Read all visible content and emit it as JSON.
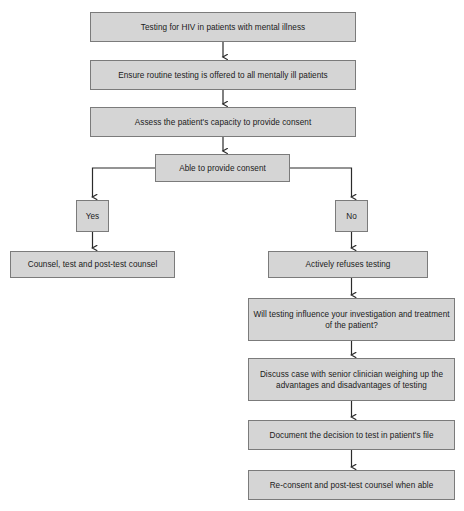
{
  "diagram": {
    "colors": {
      "node_fill": "#d5d5d5",
      "node_border": "#7b7b7b",
      "connector": "#2b2b2b",
      "background": "#ffffff",
      "text": "#1a1a1a"
    },
    "nodes": [
      {
        "id": "start",
        "label": "Testing for HIV in patients with mental illness",
        "type": "process",
        "x": 90,
        "y": 12,
        "w": 266,
        "h": 30
      },
      {
        "id": "ensure-routine",
        "label": "Ensure routine testing is offered to all mentally ill patients",
        "type": "process",
        "x": 90,
        "y": 60,
        "w": 266,
        "h": 30
      },
      {
        "id": "assess-capacity",
        "label": "Assess the patient's capacity to provide consent",
        "type": "process",
        "x": 90,
        "y": 107,
        "w": 266,
        "h": 30
      },
      {
        "id": "able-to-consent",
        "label": "Able to provide consent",
        "type": "decision",
        "x": 155,
        "y": 154,
        "w": 135,
        "h": 28
      },
      {
        "id": "yes",
        "label": "Yes",
        "type": "branch-label",
        "x": 76,
        "y": 200,
        "w": 33,
        "h": 32
      },
      {
        "id": "no",
        "label": "No",
        "type": "branch-label",
        "x": 335,
        "y": 200,
        "w": 33,
        "h": 32
      },
      {
        "id": "counsel-test",
        "label": "Counsel, test and post-test counsel",
        "type": "process",
        "x": 10,
        "y": 251,
        "w": 165,
        "h": 27
      },
      {
        "id": "actively-refuses",
        "label": "Actively refuses testing",
        "type": "process",
        "x": 268,
        "y": 251,
        "w": 160,
        "h": 27
      },
      {
        "id": "will-testing-influence",
        "label": "Will testing influence your investigation and treatment of the patient?",
        "type": "process",
        "x": 248,
        "y": 298,
        "w": 207,
        "h": 43
      },
      {
        "id": "discuss-senior",
        "label": "Discuss case with senior clinician weighing up the advantages and disadvantages of testing",
        "type": "process",
        "x": 248,
        "y": 358,
        "w": 207,
        "h": 43
      },
      {
        "id": "document-decision",
        "label": "Document the decision to test in patient's file",
        "type": "process",
        "x": 248,
        "y": 420,
        "w": 207,
        "h": 30
      },
      {
        "id": "re-consent",
        "label": "Re-consent and post-test counsel when able",
        "type": "process",
        "x": 248,
        "y": 470,
        "w": 207,
        "h": 30
      }
    ],
    "connectors": [
      {
        "id": "start-to-ensure",
        "from": "start",
        "to": "ensure-routine",
        "kind": "vertical-arrow"
      },
      {
        "id": "ensure-to-assess",
        "from": "ensure-routine",
        "to": "assess-capacity",
        "kind": "vertical-arrow"
      },
      {
        "id": "assess-to-decision",
        "from": "assess-capacity",
        "to": "able-to-consent",
        "kind": "vertical-arrow"
      },
      {
        "id": "decision-to-yes",
        "from": "able-to-consent",
        "to": "yes",
        "kind": "elbow-left-arrow"
      },
      {
        "id": "decision-to-no",
        "from": "able-to-consent",
        "to": "no",
        "kind": "elbow-right-arrow"
      },
      {
        "id": "yes-to-counsel",
        "from": "yes",
        "to": "counsel-test",
        "kind": "vertical-arrow"
      },
      {
        "id": "no-to-refuses",
        "from": "no",
        "to": "actively-refuses",
        "kind": "vertical-arrow"
      },
      {
        "id": "refuses-to-influence",
        "from": "actively-refuses",
        "to": "will-testing-influence",
        "kind": "vertical-arrow"
      },
      {
        "id": "influence-to-discuss",
        "from": "will-testing-influence",
        "to": "discuss-senior",
        "kind": "vertical-arrow"
      },
      {
        "id": "discuss-to-document",
        "from": "discuss-senior",
        "to": "document-decision",
        "kind": "vertical-arrow"
      },
      {
        "id": "document-to-reconsent",
        "from": "document-decision",
        "to": "re-consent",
        "kind": "vertical-arrow"
      }
    ]
  }
}
